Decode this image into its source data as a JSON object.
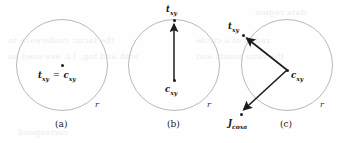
{
  "figure": {
    "width": 343,
    "height": 143,
    "background": "#fefefe",
    "circle_color": "#b9b9b9",
    "arrow_color": "#1c1c1c",
    "text_color": "#141414"
  },
  "bleed_through": [
    {
      "text": "the tactic conference to",
      "x": 8,
      "y": 36
    },
    {
      "text": "with and tog. 12, are used on",
      "x": 8,
      "y": 52
    },
    {
      "text": "radial of a circle",
      "x": 196,
      "y": 36
    },
    {
      "text": "the ratio points and",
      "x": 196,
      "y": 52
    },
    {
      "text": "data region",
      "x": 255,
      "y": 8
    },
    {
      "text": "correspond",
      "x": 18,
      "y": 128
    }
  ],
  "panels": [
    {
      "id": "a",
      "caption": "(a)",
      "caption_x": 55,
      "caption_y": 124,
      "circle": {
        "cx": 62,
        "cy": 65,
        "r": 46
      },
      "radius_label": {
        "text": "r",
        "x": 95,
        "y": 105
      },
      "points": [
        {
          "name": "center",
          "x": 62,
          "y": 65
        }
      ],
      "labels": [
        {
          "id": "t-equals-c",
          "parts": [
            "t",
            "xy",
            " = ",
            "c",
            "xy"
          ],
          "x": 40,
          "y": 71
        }
      ],
      "arrows": []
    },
    {
      "id": "b",
      "caption": "(b)",
      "caption_x": 167,
      "caption_y": 124,
      "circle": {
        "cx": 174,
        "cy": 65,
        "r": 46
      },
      "radius_label": {
        "text": "r",
        "x": 207,
        "y": 105
      },
      "points": [
        {
          "name": "center",
          "x": 174,
          "y": 80
        },
        {
          "name": "target",
          "x": 174,
          "y": 20
        }
      ],
      "labels": [
        {
          "id": "t-xy",
          "parts": [
            "t",
            "xy"
          ],
          "x": 166,
          "y": 5
        },
        {
          "id": "c-xy",
          "parts": [
            "c",
            "xy"
          ],
          "x": 165,
          "y": 85
        }
      ],
      "arrows": [
        {
          "id": "c-to-t",
          "x1": 174,
          "y1": 80,
          "x2": 174,
          "y2": 22
        }
      ]
    },
    {
      "id": "c",
      "caption": "(c)",
      "caption_x": 280,
      "caption_y": 124,
      "circle": {
        "cx": 287,
        "cy": 65,
        "r": 46
      },
      "radius_label": {
        "text": "r",
        "x": 320,
        "y": 105
      },
      "points": [
        {
          "name": "center",
          "x": 287,
          "y": 70
        },
        {
          "name": "target",
          "x": 243,
          "y": 35
        },
        {
          "name": "coxa",
          "x": 240,
          "y": 113
        }
      ],
      "labels": [
        {
          "id": "t-xy",
          "parts": [
            "t",
            "xy"
          ],
          "x": 228,
          "y": 22
        },
        {
          "id": "c-xy",
          "parts": [
            "c",
            "xy"
          ],
          "x": 292,
          "y": 73
        },
        {
          "id": "j-coxa",
          "parts": [
            "J",
            "coxa"
          ],
          "x": 224,
          "y": 118
        }
      ],
      "arrows": [
        {
          "id": "center-to-target",
          "x1": 287,
          "y1": 70,
          "x2": 245,
          "y2": 37
        },
        {
          "id": "center-to-coxa",
          "x1": 287,
          "y1": 70,
          "x2": 242,
          "y2": 111
        }
      ]
    }
  ]
}
